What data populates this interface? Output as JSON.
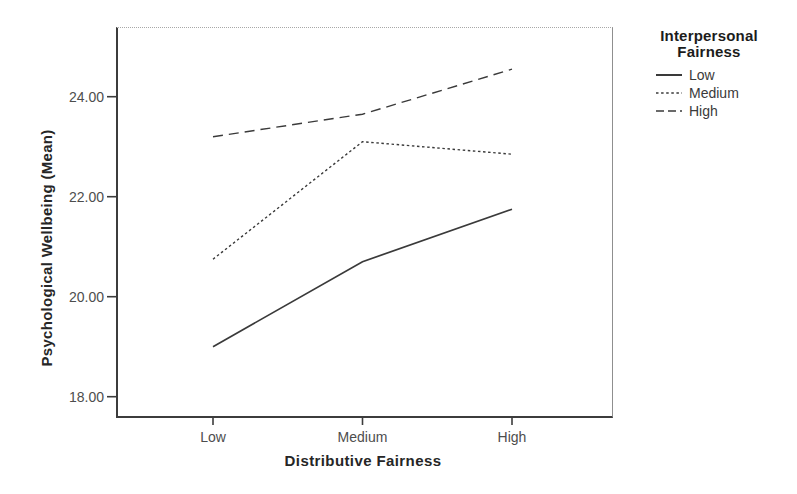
{
  "figure": {
    "background": "#ffffff",
    "line_color": "#3a3a3a",
    "axis_color": "#3c3c3c",
    "tick_text_color": "#4d4d4d"
  },
  "chart_data": {
    "type": "line",
    "title": "",
    "categories": [
      "Low",
      "Medium",
      "High"
    ],
    "xlabel": "Distributive Fairness",
    "ylabel": "Psychological Wellbeing (Mean)",
    "yticks": [
      18,
      20,
      22,
      24
    ],
    "ytick_labels": [
      "18.00",
      "20.00",
      "22.00",
      "24.00"
    ],
    "ylim": [
      17.6,
      25.4
    ],
    "grid": false,
    "legend": {
      "title": "Interpersonal Fairness",
      "title_lines": [
        "Interpersonal",
        "Fairness"
      ],
      "position": "right-top",
      "entries": [
        {
          "label": "Low",
          "style": "solid"
        },
        {
          "label": "Medium",
          "style": "dotted"
        },
        {
          "label": "High",
          "style": "dashed"
        }
      ]
    },
    "series": [
      {
        "name": "Low",
        "style": "solid",
        "values": [
          19.0,
          20.7,
          21.75
        ]
      },
      {
        "name": "Medium",
        "style": "dotted",
        "values": [
          20.75,
          23.1,
          22.85
        ]
      },
      {
        "name": "High",
        "style": "dashed",
        "values": [
          23.2,
          23.65,
          24.55
        ]
      }
    ]
  }
}
